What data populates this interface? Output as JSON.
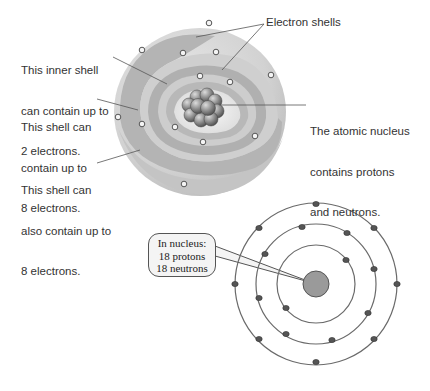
{
  "labels": {
    "electron_shells": "Electron shells",
    "inner_shell": [
      "This inner shell",
      "can contain up to",
      "2 electrons."
    ],
    "middle_shell": [
      "This shell can",
      "contain up to",
      "8 electrons."
    ],
    "outer_shell": [
      "This shell can",
      "also contain up to",
      "8 electrons."
    ],
    "nucleus": [
      "The atomic nucleus",
      "contains protons",
      "and neutrons."
    ]
  },
  "panel": {
    "title_line1": "This atom can also be represented",
    "title_line2": "in two dimensions."
  },
  "callout": {
    "line1": "In nucleus:",
    "line2": "18 protons",
    "line3": "18 neutrons"
  },
  "atom_2d": {
    "shells": [
      {
        "name": "inner",
        "electrons": 2
      },
      {
        "name": "middle",
        "electrons": 8
      },
      {
        "name": "outer",
        "electrons": 8
      }
    ],
    "protons": 18,
    "neutrons": 18
  },
  "colors": {
    "shell_light": "#d8d8d8",
    "shell_mid": "#bdbdbd",
    "shell_dark": "#a8a8a8",
    "nucleus_2d": "#9a9a9a",
    "electron_2d": "#555555",
    "panel_bg": "#f0f0f0"
  }
}
